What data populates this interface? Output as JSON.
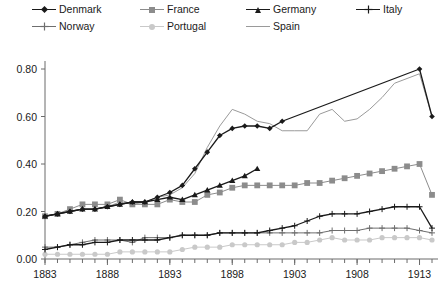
{
  "chart_data": {
    "type": "line",
    "title": "",
    "xlabel": "",
    "ylabel": "",
    "xlim": [
      1883,
      1914
    ],
    "ylim": [
      0.0,
      0.8
    ],
    "grid": false,
    "legend_position": "top",
    "y_ticks": [
      "0.00",
      "0.20",
      "0.40",
      "0.60",
      "0.80"
    ],
    "y_tick_values": [
      0.0,
      0.2,
      0.4,
      0.6,
      0.8
    ],
    "x_ticks": [
      "1883",
      "1888",
      "1893",
      "1898",
      "1903",
      "1908",
      "1913"
    ],
    "x_tick_values": [
      1883,
      1888,
      1893,
      1898,
      1903,
      1908,
      1913
    ],
    "x_minor_step": 1,
    "series": [
      {
        "name": "Denmark",
        "color": "#1a1a1a",
        "marker": "diamond",
        "x": [
          1883,
          1884,
          1885,
          1886,
          1887,
          1888,
          1889,
          1890,
          1891,
          1892,
          1893,
          1894,
          1895,
          1896,
          1897,
          1898,
          1899,
          1900,
          1901,
          1902,
          1913,
          1914
        ],
        "values": [
          0.18,
          0.19,
          0.2,
          0.21,
          0.21,
          0.22,
          0.23,
          0.24,
          0.24,
          0.26,
          0.28,
          0.31,
          0.38,
          0.45,
          0.52,
          0.55,
          0.56,
          0.56,
          0.55,
          0.58,
          0.8,
          0.6
        ]
      },
      {
        "name": "France",
        "color": "#8c8c8c",
        "marker": "square",
        "x": [
          1883,
          1884,
          1885,
          1886,
          1887,
          1888,
          1889,
          1890,
          1891,
          1892,
          1893,
          1894,
          1895,
          1896,
          1897,
          1898,
          1899,
          1900,
          1901,
          1902,
          1903,
          1904,
          1905,
          1906,
          1907,
          1908,
          1909,
          1910,
          1911,
          1912,
          1913,
          1914
        ],
        "values": [
          0.18,
          0.19,
          0.21,
          0.23,
          0.23,
          0.23,
          0.25,
          0.23,
          0.23,
          0.23,
          0.25,
          0.24,
          0.24,
          0.27,
          0.28,
          0.3,
          0.31,
          0.31,
          0.31,
          0.31,
          0.31,
          0.32,
          0.32,
          0.33,
          0.34,
          0.35,
          0.36,
          0.37,
          0.38,
          0.39,
          0.4,
          0.27
        ]
      },
      {
        "name": "Germany",
        "color": "#1a1a1a",
        "marker": "triangle",
        "x": [
          1883,
          1884,
          1885,
          1886,
          1887,
          1888,
          1889,
          1890,
          1891,
          1892,
          1893,
          1894,
          1895,
          1896,
          1897,
          1898,
          1899,
          1900
        ],
        "values": [
          0.18,
          0.19,
          0.2,
          0.21,
          0.21,
          0.22,
          0.23,
          0.24,
          0.24,
          0.25,
          0.26,
          0.25,
          0.27,
          0.29,
          0.31,
          0.33,
          0.35,
          0.38
        ]
      },
      {
        "name": "Italy",
        "color": "#1a1a1a",
        "marker": "plus",
        "x": [
          1883,
          1884,
          1885,
          1886,
          1887,
          1888,
          1889,
          1890,
          1891,
          1892,
          1893,
          1894,
          1895,
          1896,
          1897,
          1898,
          1899,
          1900,
          1901,
          1902,
          1903,
          1904,
          1905,
          1906,
          1907,
          1908,
          1909,
          1910,
          1911,
          1912,
          1913,
          1914
        ],
        "values": [
          0.04,
          0.05,
          0.06,
          0.06,
          0.07,
          0.07,
          0.08,
          0.08,
          0.08,
          0.08,
          0.09,
          0.1,
          0.1,
          0.1,
          0.11,
          0.11,
          0.11,
          0.11,
          0.12,
          0.13,
          0.14,
          0.16,
          0.18,
          0.19,
          0.19,
          0.19,
          0.2,
          0.21,
          0.22,
          0.22,
          0.22,
          0.13
        ]
      },
      {
        "name": "Norway",
        "color": "#6e6e6e",
        "marker": "plus",
        "x": [
          1883,
          1884,
          1885,
          1886,
          1887,
          1888,
          1889,
          1890,
          1891,
          1892,
          1893,
          1894,
          1895,
          1896,
          1897,
          1898,
          1899,
          1900,
          1901,
          1902,
          1903,
          1904,
          1905,
          1906,
          1907,
          1908,
          1909,
          1910,
          1911,
          1912,
          1913,
          1914
        ],
        "values": [
          0.05,
          0.05,
          0.06,
          0.07,
          0.08,
          0.08,
          0.08,
          0.07,
          0.09,
          0.09,
          0.09,
          0.1,
          0.1,
          0.1,
          0.11,
          0.11,
          0.11,
          0.11,
          0.11,
          0.11,
          0.11,
          0.11,
          0.11,
          0.12,
          0.12,
          0.12,
          0.13,
          0.13,
          0.13,
          0.13,
          0.12,
          0.11
        ]
      },
      {
        "name": "Portugal",
        "color": "#c9c9c9",
        "marker": "circle",
        "x": [
          1883,
          1884,
          1885,
          1886,
          1887,
          1888,
          1889,
          1890,
          1891,
          1892,
          1893,
          1894,
          1895,
          1896,
          1897,
          1898,
          1899,
          1900,
          1901,
          1902,
          1903,
          1904,
          1905,
          1906,
          1907,
          1908,
          1909,
          1910,
          1911,
          1912,
          1913,
          1914
        ],
        "values": [
          0.02,
          0.02,
          0.02,
          0.02,
          0.02,
          0.02,
          0.03,
          0.03,
          0.03,
          0.03,
          0.03,
          0.04,
          0.05,
          0.05,
          0.05,
          0.06,
          0.06,
          0.06,
          0.06,
          0.06,
          0.07,
          0.07,
          0.08,
          0.09,
          0.08,
          0.08,
          0.08,
          0.09,
          0.09,
          0.09,
          0.09,
          0.08
        ]
      },
      {
        "name": "Spain",
        "color": "#9a9a9a",
        "marker": "none",
        "x": [
          1883,
          1884,
          1885,
          1886,
          1887,
          1888,
          1889,
          1890,
          1891,
          1892,
          1893,
          1894,
          1895,
          1896,
          1897,
          1898,
          1899,
          1900,
          1901,
          1902,
          1903,
          1904,
          1905,
          1906,
          1907,
          1908,
          1909,
          1910,
          1911,
          1912,
          1913,
          1914
        ],
        "values": [
          0.18,
          0.19,
          0.2,
          0.21,
          0.21,
          0.22,
          0.24,
          0.23,
          0.24,
          0.26,
          0.27,
          0.3,
          0.36,
          0.47,
          0.56,
          0.63,
          0.61,
          0.58,
          0.57,
          0.54,
          0.54,
          0.54,
          0.61,
          0.63,
          0.58,
          0.59,
          0.63,
          0.68,
          0.74,
          0.76,
          0.78,
          0.6
        ]
      }
    ]
  },
  "legend": {
    "entries": [
      {
        "label": "Denmark",
        "marker": "diamond-marker",
        "color": "#1a1a1a"
      },
      {
        "label": "France",
        "marker": "square-marker",
        "color": "#8c8c8c"
      },
      {
        "label": "Germany",
        "marker": "triangle-marker",
        "color": "#1a1a1a"
      },
      {
        "label": "Italy",
        "marker": "plus-marker",
        "color": "#1a1a1a"
      },
      {
        "label": "Norway",
        "marker": "plus-marker",
        "color": "#6e6e6e"
      },
      {
        "label": "Portugal",
        "marker": "circle-marker",
        "color": "#c9c9c9"
      },
      {
        "label": "Spain",
        "marker": "line-marker",
        "color": "#9a9a9a"
      }
    ]
  }
}
